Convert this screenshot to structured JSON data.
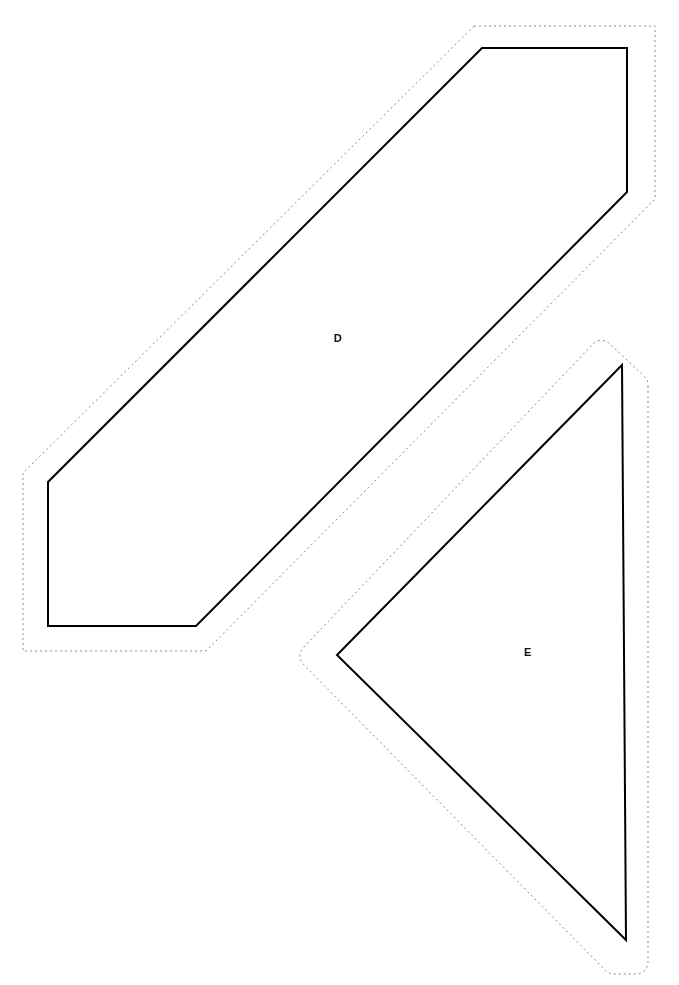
{
  "document": {
    "kind": "sewing-pattern-sheet",
    "width": 679,
    "height": 985,
    "background_color": "#ffffff"
  },
  "style": {
    "cut_line_color": "#000000",
    "cut_line_width": 2,
    "seam_line_color": "#8a8a8a",
    "seam_line_width": 1,
    "seam_dash": "2 3",
    "label_color": "#111111",
    "label_font_size": 11
  },
  "pieces": [
    {
      "id": "piece-d",
      "label": "D",
      "label_position": {
        "x": 338,
        "y": 338
      },
      "cut_line_points": "482,48 627,48 627,192 196,626 48,626 48,482",
      "seam_line_points": "474,26 655,26 655,199 206,651 23,651 23,473",
      "seam_corner_radius": 6
    },
    {
      "id": "piece-e",
      "label": "E",
      "label_position": {
        "x": 528,
        "y": 652
      },
      "cut_line_points": "622,365 626,940 337,655",
      "seam_line_path": "M 648,386 L 648,962 A 12 12 0 0 1 636,974 L 614,974 A 12 12 0 0 1 605,970 L 304,665 A 12 12 0 0 1 303,648 L 592,345 A 12 12 0 0 1 610,344 L 644,376 A 12 12 0 0 1 648,386 Z",
      "seam_corner_radius": 12
    }
  ]
}
